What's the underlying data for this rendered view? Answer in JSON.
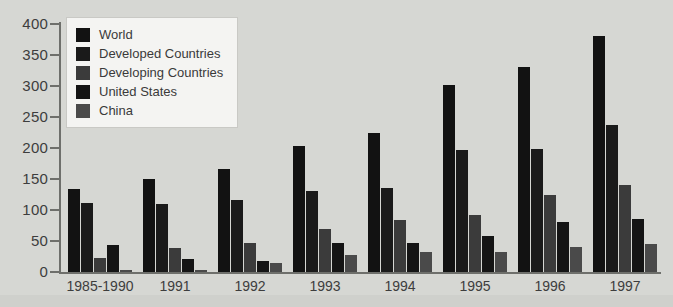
{
  "chart_data": {
    "type": "bar",
    "title": "",
    "xlabel": "",
    "ylabel": "",
    "ylim": [
      0,
      400
    ],
    "yticks": [
      0,
      50,
      100,
      150,
      200,
      250,
      300,
      350,
      400
    ],
    "grid": false,
    "legend_position": "top-left",
    "categories": [
      "1985-1990",
      "1991",
      "1992",
      "1993",
      "1994",
      "1995",
      "1996",
      "1997"
    ],
    "series": [
      {
        "name": "World",
        "color": "#121212",
        "values": [
          134,
          150,
          166,
          203,
          224,
          301,
          331,
          380
        ]
      },
      {
        "name": "Developed Countries",
        "color": "#1a1a1a",
        "values": [
          111,
          110,
          116,
          131,
          136,
          196,
          198,
          237
        ]
      },
      {
        "name": "Developing Countries",
        "color": "#3b3b3b",
        "values": [
          22,
          38,
          47,
          70,
          84,
          92,
          124,
          140
        ]
      },
      {
        "name": "United States",
        "color": "#141414",
        "values": [
          44,
          21,
          18,
          47,
          47,
          58,
          80,
          85
        ]
      },
      {
        "name": "China",
        "color": "#4a4a4a",
        "values": [
          3,
          4,
          15,
          27,
          32,
          33,
          41,
          45
        ]
      }
    ]
  },
  "axis": {
    "y_tick_labels": [
      "400",
      "350",
      "300",
      "250",
      "200",
      "150",
      "100",
      "50",
      "0"
    ]
  },
  "legend": {
    "items": [
      {
        "label": "World"
      },
      {
        "label": "Developed Countries"
      },
      {
        "label": "Developing Countries"
      },
      {
        "label": "United States"
      },
      {
        "label": "China"
      }
    ]
  },
  "colors": {
    "background": "#d6d7d3",
    "axis": "#6e6f6b",
    "text": "#3d3d3d",
    "legend_background": "#f4f4f2"
  }
}
